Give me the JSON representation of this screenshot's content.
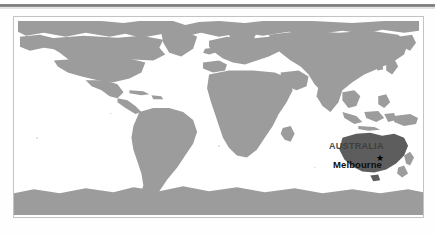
{
  "document": {
    "type": "world-map-figure",
    "projection": "equirectangular",
    "caption_rule": true
  },
  "map": {
    "title": "World map showing location of Australia and Melbourne",
    "background_color": "#ffffff",
    "frame_color": "#c3c3c3",
    "land_color": "#9c9c9c",
    "highlight_color": "#5d5d5d",
    "labels": [
      {
        "name": "AUSTRALIA",
        "text": "AUSTRALIA",
        "kind": "country-label",
        "color": "#3c3c3c"
      },
      {
        "name": "Melbourne",
        "text": "Melbourne",
        "kind": "city-label",
        "color": "#0d0d0d"
      }
    ],
    "marker": {
      "glyph": "★",
      "city": "Melbourne",
      "color": "#000000"
    },
    "regions": [
      "North America",
      "South America",
      "Greenland",
      "Europe",
      "Africa",
      "Asia",
      "Australia",
      "New Zealand",
      "Antarctica"
    ]
  }
}
